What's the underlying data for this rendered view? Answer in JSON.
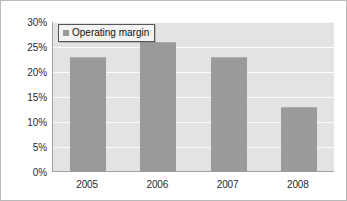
{
  "chart_data": {
    "type": "bar",
    "title": "",
    "xlabel": "",
    "ylabel": "",
    "categories": [
      "2005",
      "2006",
      "2007",
      "2008"
    ],
    "series": [
      {
        "name": "Operating margin",
        "values": [
          23,
          26,
          23,
          13
        ]
      }
    ],
    "value_suffix": "%",
    "ylim": [
      0,
      30
    ],
    "ytick_values": [
      30,
      25,
      20,
      15,
      10,
      5,
      0
    ],
    "ytick_labels": [
      "30%",
      "25%",
      "20%",
      "15%",
      "10%",
      "5%",
      "0%"
    ],
    "grid": true,
    "legend_position": "top-left-inside",
    "colors": {
      "bar": "#9a9a9a",
      "plot_background": "#e3e3e3",
      "gridline": "#fbfbfb",
      "axis_line": "#a2a2a2",
      "figure_border": "#b9b9b9",
      "text": "#2b2b2b",
      "legend_background": "#f3f3f3",
      "legend_border": "#565656"
    }
  },
  "legend": {
    "swatch_icon": "legend-swatch-square",
    "label": "Operating margin"
  },
  "axis": {
    "y_labels": [
      "30%",
      "25%",
      "20%",
      "15%",
      "10%",
      "5%",
      "0%"
    ],
    "x_labels": [
      "2005",
      "2006",
      "2007",
      "2008"
    ]
  }
}
